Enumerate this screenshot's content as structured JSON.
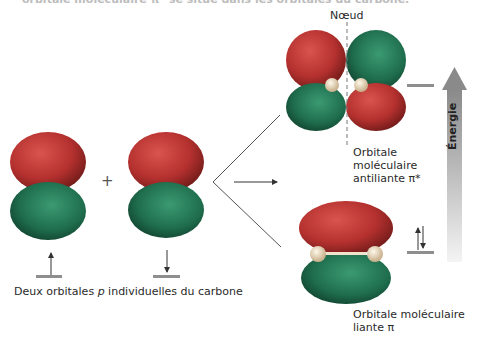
{
  "header": {
    "cut_text": "orbitale moléculaire π* se situe dans les orbitales du carbone."
  },
  "labels": {
    "node": "Nœud",
    "antibonding": [
      "Orbitale",
      "moléculaire",
      "antiliante π*"
    ],
    "bonding": [
      "Orbitale moléculaire",
      "liante π"
    ],
    "p_orbitals": "Deux orbitales p individuelles du carbone",
    "p_italic": "p",
    "p_before": "Deux orbitales ",
    "p_after": " individuelles du carbone",
    "plus": "+",
    "energy": "Énergie"
  },
  "colors": {
    "positive_lobe": "#b5312f",
    "negative_lobe": "#1f6e4e",
    "nucleus": "#e9d6b8",
    "level_line": "#8e8e8e",
    "energy_arrow_top": "#8a8a8a",
    "energy_arrow_bottom": "#f2f2f2"
  },
  "electrons": {
    "p_left": "up",
    "p_right": "down",
    "pi_bonding": "pair",
    "pi_antibonding": "empty"
  }
}
